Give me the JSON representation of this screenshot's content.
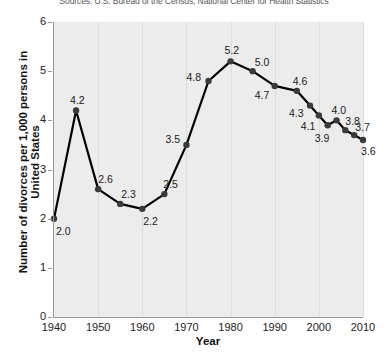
{
  "source_note": "Sources: U.S. Bureau of the Census; National Center for Health Statistics",
  "axis": {
    "ylabel": "Number of divorces per 1,000 persons in United States",
    "xlabel": "Year",
    "yticks": [
      "0",
      "1",
      "2",
      "3",
      "4",
      "5",
      "6"
    ],
    "xticks": [
      "1940",
      "1950",
      "1960",
      "1970",
      "1980",
      "1990",
      "2000",
      "2010"
    ]
  },
  "colors": {
    "plot_background": "#ececec",
    "line": "#000000",
    "marker": "#3a3a3a",
    "gridline": "#dcdcdc",
    "axis": "#9a9a9a",
    "text": "#222222"
  },
  "chart_data": {
    "type": "line",
    "title": "",
    "subtitle": "",
    "xlabel": "Year",
    "ylabel": "Number of divorces per 1,000 persons in United States",
    "xlim": [
      1940,
      2010
    ],
    "ylim": [
      0,
      6
    ],
    "xtick_values": [
      1940,
      1950,
      1960,
      1970,
      1980,
      1990,
      2000,
      2010
    ],
    "ytick_values": [
      0,
      1,
      2,
      3,
      4,
      5,
      6
    ],
    "grid": "vertical",
    "legend": "none",
    "series": [
      {
        "name": "Divorce rate",
        "x": [
          1940,
          1945,
          1950,
          1955,
          1960,
          1965,
          1970,
          1975,
          1980,
          1985,
          1990,
          1995,
          1998,
          2000,
          2002,
          2004,
          2006,
          2008,
          2010
        ],
        "values": [
          2.0,
          4.2,
          2.6,
          2.3,
          2.2,
          2.5,
          3.5,
          4.8,
          5.2,
          5.0,
          4.7,
          4.6,
          4.3,
          4.1,
          3.9,
          4.0,
          3.8,
          3.7,
          3.6
        ],
        "data_labels": [
          "2.0",
          "4.2",
          "2.6",
          "2.3",
          "2.2",
          "2.5",
          "3.5",
          "4.8",
          "5.2",
          "5.0",
          "4.7",
          "4.6",
          "4.3",
          "4.1",
          "3.9",
          "4.0",
          "3.8",
          "3.7",
          "3.6"
        ],
        "label_positions": [
          "below",
          "above",
          "above",
          "above",
          "below",
          "above",
          "above",
          "above",
          "above",
          "above",
          "below",
          "above",
          "below",
          "below",
          "below",
          "above",
          "above",
          "above",
          "below"
        ]
      }
    ]
  }
}
